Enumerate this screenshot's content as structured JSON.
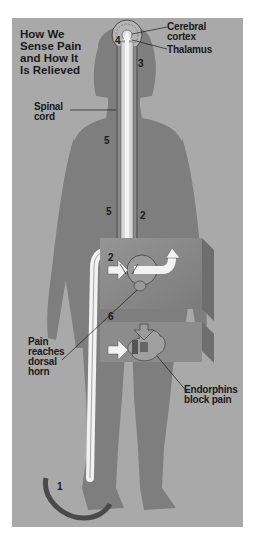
{
  "diagram": {
    "title": "How We Sense Pain and How It Is Relieved",
    "title_lines": [
      "How We",
      "Sense Pain",
      "and How It",
      "Is Relieved"
    ],
    "labels": {
      "cerebral_cortex": [
        "Cerebral",
        "cortex"
      ],
      "thalamus": "Thalamus",
      "spinal_cord": [
        "Spinal",
        "cord"
      ],
      "pain_reaches_dorsal_horn": [
        "Pain",
        "reaches",
        "dorsal",
        "horn"
      ],
      "endorphins_block_pain": [
        "Endorphins",
        "block pain"
      ]
    },
    "step_numbers": {
      "foot": "1",
      "dorsal_horn_right": "2",
      "box_top": "2",
      "thalamus_side": "3",
      "brain": "4",
      "spinal_mid": "5",
      "dorsal_horn_left": "5",
      "box_bottom": "6"
    },
    "colors": {
      "background": "#a9a9a9",
      "body_silhouette": "#7e7e7e",
      "pathway": "#f2f2f2",
      "box": "#8c8c8c",
      "text": "#1a1a1a",
      "arc": "#4a4a4a"
    }
  }
}
